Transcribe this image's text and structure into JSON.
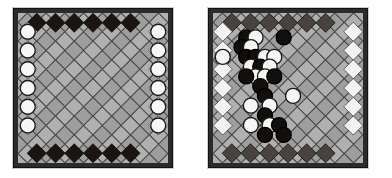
{
  "figure": {
    "background_color": "#ffffff",
    "width": 392,
    "height": 178,
    "caption": "",
    "panel_count": 2
  },
  "palette": {
    "board_background": "#a8a8a8",
    "board_border_dark": "#2b2b2b",
    "board_border_outer": "#111111",
    "cell_light": "#b0b0b0",
    "cell_light_alt": "#9e9e9e",
    "cell_dark": "#1a1512",
    "cell_dark_soft": "#4a4240",
    "cell_white": "#f2f2ef",
    "grid_line": "#4b4b4b",
    "piece_white_fill": "#f6f6f4",
    "piece_white_edge": "#1b1b1b",
    "piece_black_fill": "#120f0d",
    "piece_black_edge": "#000000"
  },
  "boards": [
    {
      "id": "left-board",
      "name": "starting-position-board",
      "label": "",
      "x": 13,
      "y": 8,
      "size": 160,
      "orientation": "diamond",
      "grid": 8,
      "edge_top_cells": 6,
      "edge_bottom_cells": 6,
      "edge_left_cells": 6,
      "edge_right_cells": 6,
      "edge_top_color": "#1a1512",
      "edge_bottom_color": "#1a1512",
      "edge_left_color": "#f2f2ef",
      "edge_right_color": "#f2f2ef",
      "interior_color": "#a8a8a8",
      "pieces": [
        {
          "row": 1,
          "col": 0,
          "color": "white"
        },
        {
          "row": 2,
          "col": 0,
          "color": "white"
        },
        {
          "row": 3,
          "col": 0,
          "color": "white"
        },
        {
          "row": 4,
          "col": 0,
          "color": "white"
        },
        {
          "row": 5,
          "col": 0,
          "color": "white"
        },
        {
          "row": 6,
          "col": 0,
          "color": "white"
        },
        {
          "row": 1,
          "col": 7,
          "color": "white"
        },
        {
          "row": 2,
          "col": 7,
          "color": "white"
        },
        {
          "row": 3,
          "col": 7,
          "color": "white"
        },
        {
          "row": 4,
          "col": 7,
          "color": "white"
        },
        {
          "row": 5,
          "col": 7,
          "color": "white"
        },
        {
          "row": 6,
          "col": 7,
          "color": "white"
        }
      ],
      "white_piece_count": 12,
      "black_piece_count": 0
    },
    {
      "id": "right-board",
      "name": "midgame-position-board",
      "label": "",
      "x": 208,
      "y": 8,
      "size": 160,
      "orientation": "diamond",
      "grid": 8,
      "edge_top_cells": 6,
      "edge_bottom_cells": 6,
      "edge_left_cells": 6,
      "edge_right_cells": 6,
      "edge_top_color": "#4a4240",
      "edge_bottom_color": "#4a4240",
      "edge_left_color": "#f2f2ef",
      "edge_right_color": "#f2f2ef",
      "interior_color": "#a8a8a8",
      "pieces": [
        {
          "row": 1,
          "col": 1,
          "color": "black"
        },
        {
          "row": 1,
          "col": 5,
          "color": "black"
        },
        {
          "row": 1,
          "col": 2,
          "color": "white"
        },
        {
          "row": 2,
          "col": 1,
          "color": "black"
        },
        {
          "row": 2,
          "col": 2,
          "color": "white"
        },
        {
          "row": 3,
          "col": 0,
          "color": "white"
        },
        {
          "row": 3,
          "col": 1,
          "color": "black"
        },
        {
          "row": 3,
          "col": 2,
          "color": "black"
        },
        {
          "row": 3,
          "col": 3,
          "color": "white"
        },
        {
          "row": 3,
          "col": 4,
          "color": "white"
        },
        {
          "row": 4,
          "col": 2,
          "color": "white"
        },
        {
          "row": 4,
          "col": 3,
          "color": "black"
        },
        {
          "row": 4,
          "col": 4,
          "color": "white"
        },
        {
          "row": 5,
          "col": 2,
          "color": "white"
        },
        {
          "row": 5,
          "col": 3,
          "color": "white"
        },
        {
          "row": 5,
          "col": 4,
          "color": "black"
        },
        {
          "row": 5,
          "col": 1,
          "color": "black"
        },
        {
          "row": 6,
          "col": 3,
          "color": "black"
        },
        {
          "row": 7,
          "col": 3,
          "color": "black"
        },
        {
          "row": 7,
          "col": 6,
          "color": "white"
        },
        {
          "row": 8,
          "col": 2,
          "color": "white"
        },
        {
          "row": 8,
          "col": 4,
          "color": "white"
        },
        {
          "row": 9,
          "col": 3,
          "color": "black"
        },
        {
          "row": 10,
          "col": 2,
          "color": "white"
        },
        {
          "row": 10,
          "col": 4,
          "color": "white"
        },
        {
          "row": 10,
          "col": 5,
          "color": "black"
        },
        {
          "row": 11,
          "col": 3,
          "color": "black"
        },
        {
          "row": 11,
          "col": 5,
          "color": "black"
        }
      ],
      "white_piece_count": 13,
      "black_piece_count": 15
    }
  ]
}
